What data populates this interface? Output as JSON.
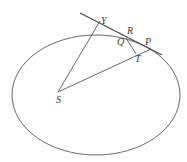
{
  "diagram": {
    "type": "geometry",
    "colors": {
      "stroke": "#555555",
      "label": "#3a3a3a",
      "background": "#ffffff"
    },
    "labels": {
      "Y": "Y",
      "R": "R",
      "Q": "Q",
      "P": "P",
      "T": "T",
      "S": "S"
    },
    "shapes": {
      "ellipse": {
        "cx": 96,
        "cy": 95,
        "rx": 84,
        "ry": 60
      },
      "tangent_line": {
        "x1": 80,
        "y1": 13,
        "x2": 162,
        "y2": 55
      },
      "SY": {
        "x1": 58,
        "y1": 92,
        "x2": 100,
        "y2": 21
      },
      "SP": {
        "x1": 58,
        "y1": 92,
        "x2": 151,
        "y2": 49
      },
      "QT": {
        "x1": 126,
        "y1": 38,
        "x2": 136,
        "y2": 54
      }
    }
  }
}
